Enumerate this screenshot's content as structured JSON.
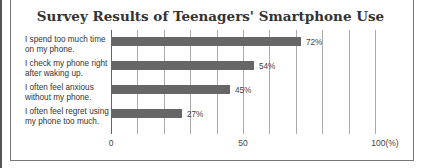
{
  "chart_data": {
    "type": "bar",
    "orientation": "horizontal",
    "title": "Survey Results of Teenagers' Smartphone Use",
    "categories": [
      "I spend too much time on my phone.",
      "I check my phone right after waking up.",
      "I often feel anxious without my phone.",
      "I often feel regret using my phone too much."
    ],
    "category_lines": [
      [
        "I spend too much time",
        "on my phone."
      ],
      [
        "I check my phone right",
        "after waking up."
      ],
      [
        "I often feel anxious",
        "without my phone."
      ],
      [
        "I often feel regret using",
        "my phone too much."
      ]
    ],
    "values": [
      72,
      54,
      45,
      27
    ],
    "value_labels": [
      "72%",
      "54%",
      "45%",
      "27%"
    ],
    "xlabel": "",
    "ylabel": "",
    "xlim": [
      0,
      100
    ],
    "x_ticks": [
      "0",
      "50",
      "100(%)"
    ],
    "grid": true,
    "grid_step": 10,
    "bar_color": "#666666"
  }
}
